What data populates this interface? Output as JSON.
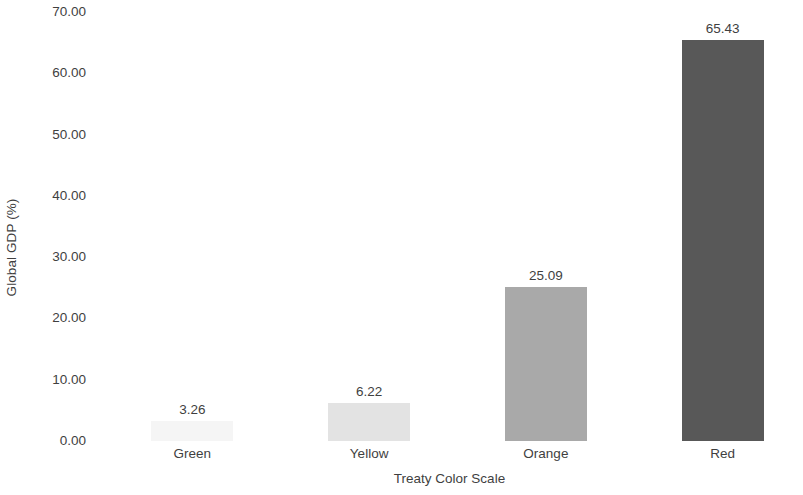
{
  "chart_data": {
    "type": "bar",
    "title": "",
    "subtitle": "",
    "xlabel": "Treaty Color Scale",
    "ylabel": "Global GDP (%)",
    "categories": [
      "Green",
      "Yellow",
      "Orange",
      "Red"
    ],
    "values": [
      3.26,
      6.22,
      25.09,
      65.43
    ],
    "value_labels": [
      "3.26",
      "6.22",
      "25.09",
      "65.43"
    ],
    "series": [
      {
        "name": "Global GDP (%)",
        "values": [
          3.26,
          6.22,
          25.09,
          65.43
        ]
      }
    ],
    "bar_colors": [
      "#f5f5f5",
      "#e3e3e3",
      "#a9a9a9",
      "#585858"
    ],
    "ylim": [
      0,
      70
    ],
    "ytick_step": 10,
    "ytick_labels": [
      "70.00",
      "60.00",
      "50.00",
      "40.00",
      "30.00",
      "20.00",
      "10.00",
      "0.00"
    ],
    "ytick_values": [
      70,
      60,
      50,
      40,
      30,
      20,
      10,
      0
    ],
    "grid": false,
    "legend": false,
    "legend_position": "none",
    "data_labels_shown": true,
    "background_color": "#ffffff",
    "text_color": "#3f3f3f"
  }
}
